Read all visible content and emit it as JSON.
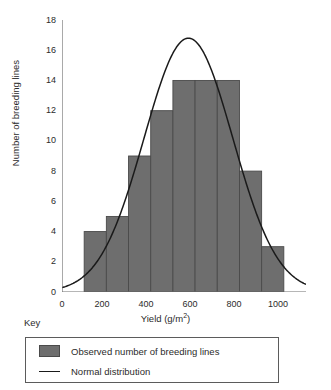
{
  "chart_data": {
    "type": "bar",
    "title": "",
    "xlabel": "Yield (g/m2)",
    "ylabel": "Number of breeding lines",
    "xlim": [
      0,
      1100
    ],
    "ylim": [
      0,
      18
    ],
    "grid": false,
    "legend_position": "below-plot",
    "bin_width": 100,
    "bin_edges": [
      100,
      200,
      300,
      400,
      500,
      600,
      700,
      800,
      900,
      1000
    ],
    "categories": [
      "100-200",
      "200-300",
      "300-400",
      "400-500",
      "500-600",
      "600-700",
      "700-800",
      "800-900",
      "900-1000"
    ],
    "values": [
      4,
      5,
      9,
      12,
      14,
      14,
      14,
      8,
      3
    ],
    "series": [
      {
        "name": "Observed number of breeding lines",
        "type": "bar",
        "color": "#6e6e6e",
        "values": [
          4,
          5,
          9,
          12,
          14,
          14,
          14,
          8,
          3
        ]
      },
      {
        "name": "Normal distribution",
        "type": "line",
        "color": "#1a1a1a",
        "mean": 570,
        "sigma": 200,
        "peak": 16.8,
        "x": [
          0,
          100,
          200,
          300,
          400,
          500,
          570,
          600,
          700,
          800,
          900,
          1000,
          1100
        ],
        "y": [
          0.25,
          1.0,
          2.9,
          6.4,
          11.0,
          15.4,
          16.8,
          16.6,
          13.4,
          8.4,
          4.2,
          1.6,
          0.5
        ]
      }
    ],
    "y_ticks": [
      0,
      2,
      4,
      6,
      8,
      10,
      12,
      14,
      16,
      18
    ],
    "x_ticks": [
      0,
      200,
      400,
      600,
      800,
      1000
    ],
    "y_tick_labels": [
      "0",
      "2",
      "4",
      "6",
      "8",
      "10",
      "12",
      "14",
      "16",
      "18"
    ],
    "x_tick_labels": [
      "0",
      "200",
      "400",
      "600",
      "800",
      "1000"
    ]
  },
  "axes": {
    "y_label": "Number of breeding lines",
    "x_label_main": "Yield (g/m",
    "x_label_sup": "2",
    "x_label_tail": ")",
    "y_ticks": [
      "0",
      "2",
      "4",
      "6",
      "8",
      "10",
      "12",
      "14",
      "16",
      "18"
    ],
    "x_ticks": [
      "0",
      "200",
      "400",
      "600",
      "800",
      "1000"
    ]
  },
  "key": {
    "title": "Key",
    "entries": [
      {
        "marker": "swatch",
        "label": "Observed number of breeding lines"
      },
      {
        "marker": "line",
        "label": "Normal distribution"
      }
    ]
  },
  "colors": {
    "bar_fill": "#6e6e6e",
    "bar_stroke": "#4a4a4a",
    "curve": "#1a1a1a",
    "axis": "#6f6f6f",
    "text": "#2b2b2b",
    "background": "#ffffff"
  }
}
